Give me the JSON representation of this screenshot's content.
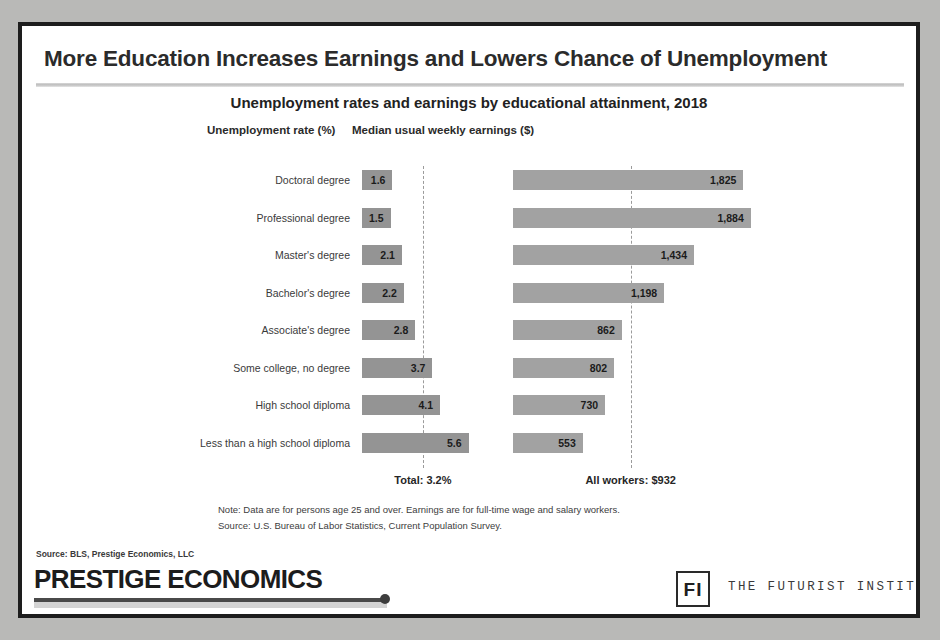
{
  "slide": {
    "title": "More Education Increases Earnings and Lowers Chance of Unemployment",
    "chart_title": "Unemployment rates and earnings by educational attainment, 2018",
    "note": "Note: Data are for persons age 25 and over. Earnings are for full-time wage and salary workers.",
    "source": "Source: U.S. Bureau of Labor Statistics, Current Population Survey.",
    "footer_source": "Source: BLS, Prestige Economics, LLC",
    "brand_wordmark": "PRESTIGE ECONOMICS",
    "fi_badge": "FI",
    "fi_text": "THE FUTURIST INSTITUTE",
    "total_unemployment": "Total: 3.2%",
    "total_earnings": "All workers: $932"
  },
  "colors": {
    "bar_unemployment": "#949494",
    "bar_earnings": "#a2a2a2",
    "frame": "#1d1d1d",
    "page_background": "#b9b9b7",
    "text": "#2b2b2b"
  },
  "chart_data": {
    "type": "bar",
    "title": "Unemployment rates and earnings by educational attainment, 2018",
    "orientation": "horizontal",
    "grid": false,
    "legend": "none",
    "categories": [
      "Doctoral degree",
      "Professional degree",
      "Master's degree",
      "Bachelor's degree",
      "Associate's degree",
      "Some college, no degree",
      "High school diploma",
      "Less than a high school diploma"
    ],
    "series": [
      {
        "name": "Unemployment rate (%)",
        "axis_label": "Unemployment rate (%)",
        "unit": "%",
        "values": [
          1.6,
          1.5,
          2.1,
          2.2,
          2.8,
          3.7,
          4.1,
          5.6
        ],
        "labels": [
          "1.6",
          "1.5",
          "2.1",
          "2.2",
          "2.8",
          "3.7",
          "4.1",
          "5.6"
        ],
        "reference_line": 3.2,
        "reference_label": "Total: 3.2%",
        "xlim": [
          0,
          6.2
        ]
      },
      {
        "name": "Median usual weekly earnings ($)",
        "axis_label": "Median usual weekly earnings ($)",
        "unit": "$",
        "values": [
          1825,
          1884,
          1434,
          1198,
          862,
          802,
          730,
          553
        ],
        "labels": [
          "1,825",
          "1,884",
          "1,434",
          "1,198",
          "862",
          "802",
          "730",
          "553"
        ],
        "reference_line": 932,
        "reference_label": "All workers: $932",
        "xlim": [
          0,
          2060
        ]
      }
    ]
  }
}
